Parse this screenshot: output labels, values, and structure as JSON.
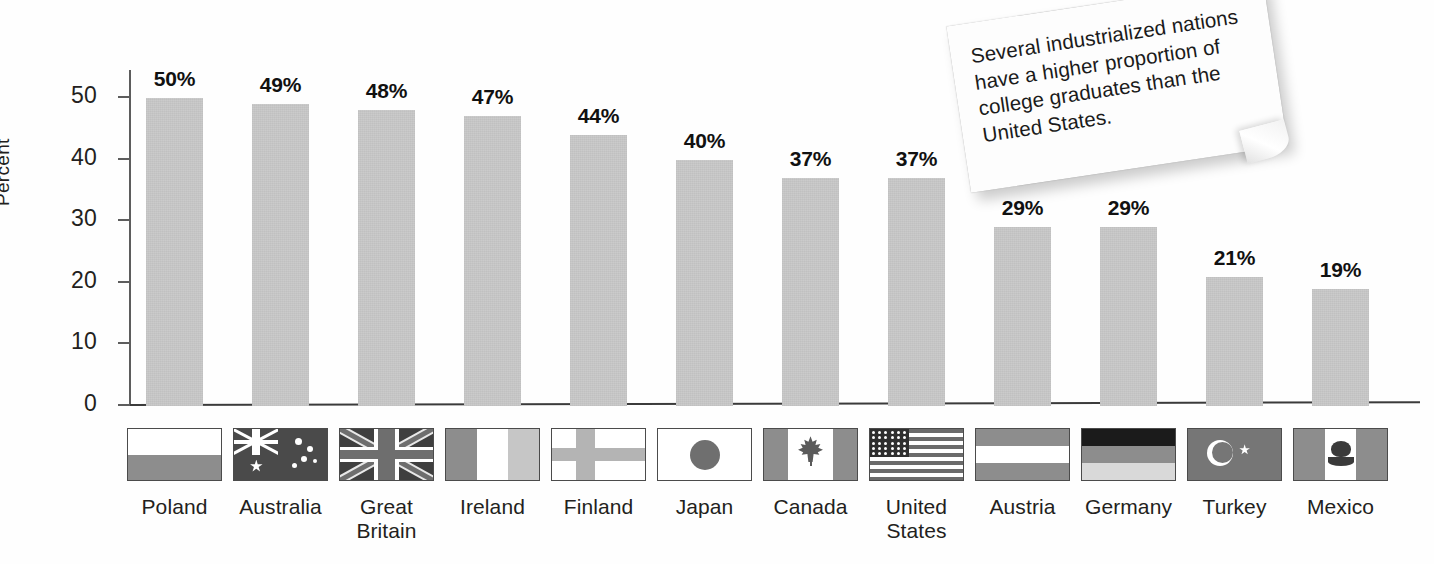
{
  "chart_data": {
    "type": "bar",
    "title": "",
    "xlabel": "",
    "ylabel": "Percent",
    "ylim": [
      0,
      55
    ],
    "grid": false,
    "legend": "none",
    "categories": [
      "Poland",
      "Australia",
      "Great Britain",
      "Ireland",
      "Finland",
      "Japan",
      "Canada",
      "United States",
      "Austria",
      "Germany",
      "Turkey",
      "Mexico"
    ],
    "values": [
      50,
      49,
      48,
      47,
      44,
      40,
      37,
      37,
      29,
      29,
      21,
      19
    ],
    "value_labels": [
      "50%",
      "49%",
      "48%",
      "47%",
      "44%",
      "40%",
      "37%",
      "37%",
      "29%",
      "29%",
      "21%",
      "19%"
    ],
    "y_ticks": [
      0,
      10,
      20,
      30,
      40,
      50
    ],
    "y_tick_labels": [
      "0",
      "10",
      "20",
      "30",
      "40",
      "50"
    ],
    "bar_color": "#c9c9c9",
    "axis_color": "#3b3b3b"
  },
  "axis": {
    "y_title": "Percent",
    "ticks": [
      {
        "label": "50",
        "value": 50
      },
      {
        "label": "40",
        "value": 40
      },
      {
        "label": "30",
        "value": 30
      },
      {
        "label": "20",
        "value": 20
      },
      {
        "label": "10",
        "value": 10
      },
      {
        "label": "0",
        "value": 0
      }
    ]
  },
  "bars": [
    {
      "country": "Poland",
      "label": "50%",
      "value": 50,
      "flag": "flag-poland"
    },
    {
      "country": "Australia",
      "label": "49%",
      "value": 49,
      "flag": "flag-australia"
    },
    {
      "country": "Great Britain",
      "label": "48%",
      "value": 48,
      "flag": "flag-great-britain"
    },
    {
      "country": "Ireland",
      "label": "47%",
      "value": 47,
      "flag": "flag-ireland"
    },
    {
      "country": "Finland",
      "label": "44%",
      "value": 44,
      "flag": "flag-finland"
    },
    {
      "country": "Japan",
      "label": "40%",
      "value": 40,
      "flag": "flag-japan"
    },
    {
      "country": "Canada",
      "label": "37%",
      "value": 37,
      "flag": "flag-canada"
    },
    {
      "country": "United States",
      "label": "37%",
      "value": 37,
      "flag": "flag-united-states"
    },
    {
      "country": "Austria",
      "label": "29%",
      "value": 29,
      "flag": "flag-austria"
    },
    {
      "country": "Germany",
      "label": "29%",
      "value": 29,
      "flag": "flag-germany"
    },
    {
      "country": "Turkey",
      "label": "21%",
      "value": 21,
      "flag": "flag-turkey"
    },
    {
      "country": "Mexico",
      "label": "19%",
      "value": 19,
      "flag": "flag-mexico"
    }
  ],
  "callout": {
    "text": "Several industrialized nations have a higher proportion of college graduates than the United States."
  }
}
